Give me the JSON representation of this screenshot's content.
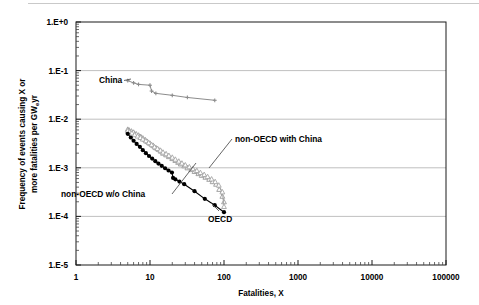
{
  "chart_data": {
    "type": "line",
    "title": "",
    "xlabel": "Fatalities, X",
    "ylabel": "Frequency of events causing X or more fatalities per GW",
    "ylabel_sub": "e",
    "ylabel_tail": "yr",
    "xscale": "log",
    "yscale": "log",
    "xlim": [
      1,
      100000
    ],
    "ylim": [
      1e-05,
      1
    ],
    "grid": "horizontal-major-only",
    "legend": "inline-annotations",
    "xticks": [
      "1",
      "10",
      "100",
      "1000",
      "10000",
      "100000"
    ],
    "xtick_values": [
      1,
      10,
      100,
      1000,
      10000,
      100000
    ],
    "yticks": [
      "1.E+0",
      "1.E-1",
      "1.E-2",
      "1.E-3",
      "1.E-4",
      "1.E-5"
    ],
    "ytick_values": [
      1,
      0.1,
      0.01,
      0.001,
      0.0001,
      1e-05
    ],
    "series": [
      {
        "name": "China",
        "color": "#8c8c8c",
        "marker": "small-cross",
        "label_text": "China",
        "x": [
          5,
          6,
          7,
          10,
          10.5,
          12,
          20,
          32,
          75
        ],
        "y": [
          0.062,
          0.056,
          0.052,
          0.05,
          0.038,
          0.034,
          0.031,
          0.028,
          0.0245
        ]
      },
      {
        "name": "non-OECD with China",
        "color": "#9a9a9a",
        "marker": "open-triangle",
        "label_text": "non-OECD with China",
        "x": [
          5,
          5.2,
          5.6,
          6,
          6.5,
          7,
          7.5,
          8,
          8.6,
          9.2,
          10,
          11,
          12,
          13,
          14,
          15,
          16.5,
          18,
          20,
          22,
          24,
          26,
          29,
          32,
          36,
          40,
          45,
          50,
          56,
          63,
          70,
          78,
          86,
          95,
          100
        ],
        "y": [
          0.0062,
          0.006,
          0.0057,
          0.0054,
          0.005,
          0.0047,
          0.0044,
          0.0041,
          0.0038,
          0.0035,
          0.0032,
          0.0029,
          0.0026,
          0.0024,
          0.0022,
          0.002,
          0.00185,
          0.0017,
          0.00155,
          0.00142,
          0.0013,
          0.0012,
          0.0011,
          0.001,
          0.00092,
          0.00084,
          0.00076,
          0.0007,
          0.00064,
          0.00058,
          0.00052,
          0.00046,
          0.00036,
          0.00026,
          0.0002
        ]
      },
      {
        "name": "non-OECD w/o China",
        "color": "#a6a6a6",
        "marker": "open-triangle",
        "label_text": "non-OECD w/o China",
        "x": [
          5,
          5.3,
          5.7,
          6.2,
          6.8,
          7.4,
          8,
          8.8,
          9.6,
          10.5,
          11.5,
          12.6,
          13.8,
          15,
          16.5,
          18,
          20,
          22,
          24.5,
          27,
          30,
          34,
          38,
          43,
          48,
          54,
          60,
          68,
          76,
          85,
          95,
          100
        ],
        "y": [
          0.0058,
          0.0055,
          0.0052,
          0.0048,
          0.0045,
          0.0042,
          0.0039,
          0.0036,
          0.0033,
          0.003,
          0.0027,
          0.0025,
          0.0023,
          0.0021,
          0.00195,
          0.0018,
          0.00165,
          0.0015,
          0.00137,
          0.00125,
          0.00115,
          0.00105,
          0.00096,
          0.00088,
          0.0008,
          0.00073,
          0.00066,
          0.00059,
          0.00052,
          0.00044,
          0.00032,
          0.00016
        ]
      },
      {
        "name": "OECD",
        "color": "#000000",
        "marker": "filled-circle",
        "label_text": "OECD",
        "x": [
          5,
          5.5,
          6,
          6.6,
          7.3,
          8,
          8.8,
          9.7,
          10.7,
          11.8,
          13,
          14.4,
          16,
          17.8,
          19.8,
          20.5,
          22,
          25,
          29,
          40,
          55,
          75,
          100
        ],
        "y": [
          0.005,
          0.0042,
          0.0036,
          0.0031,
          0.0027,
          0.0023,
          0.002,
          0.00175,
          0.00155,
          0.00137,
          0.00122,
          0.0011,
          0.00098,
          0.00088,
          0.0008,
          0.00062,
          0.00058,
          0.00052,
          0.00046,
          0.00033,
          0.00023,
          0.00017,
          0.000122
        ]
      }
    ],
    "annotations": [
      {
        "name": "china-label",
        "text": "China"
      },
      {
        "name": "non-oecd-with-china-label",
        "text": "non-OECD with China"
      },
      {
        "name": "non-oecd-wo-china-label",
        "text": "non-OECD w/o China"
      },
      {
        "name": "oecd-label",
        "text": "OECD"
      }
    ],
    "colors": {
      "axis": "#1a1a1a",
      "grid": "#b9b9b9",
      "china": "#8c8c8c",
      "non_oecd_with_china": "#9a9a9a",
      "non_oecd_wo_china": "#a6a6a6",
      "oecd": "#000000",
      "background": "#ffffff"
    }
  }
}
